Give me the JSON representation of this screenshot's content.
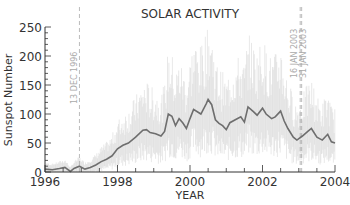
{
  "chart_data": {
    "type": "line",
    "title": "SOLAR ACTIVITY",
    "xlabel": "YEAR",
    "ylabel": "Sunspot Number",
    "xlim": [
      1996,
      2004
    ],
    "ylim": [
      0,
      250
    ],
    "xticks": [
      1996,
      1998,
      2000,
      2002,
      2004
    ],
    "yticks": [
      0,
      50,
      100,
      150,
      200,
      250
    ],
    "grid": false,
    "legend": null,
    "colors": {
      "smoothed": "#6e6e6e",
      "daily": "#d9d9d9",
      "axis": "#333333",
      "markers": "#aaaaaa"
    },
    "annotations": [
      {
        "x": 1996.95,
        "label": "13 DEC 1996",
        "style": "dashed"
      },
      {
        "x": 2003.04,
        "label": "16 JAN 2003",
        "style": "dashed"
      },
      {
        "x": 2003.08,
        "label": "31 JAN 2003",
        "style": "dashed"
      }
    ],
    "series": [
      {
        "name": "Smoothed sunspot number",
        "x": [
          1996.0,
          1996.2,
          1996.4,
          1996.55,
          1996.7,
          1996.8,
          1996.95,
          1997.1,
          1997.25,
          1997.4,
          1997.55,
          1997.7,
          1997.85,
          1998.0,
          1998.15,
          1998.3,
          1998.5,
          1998.7,
          1998.8,
          1998.9,
          1999.05,
          1999.2,
          1999.3,
          1999.4,
          1999.5,
          1999.6,
          1999.7,
          1999.8,
          1999.9,
          2000.0,
          2000.1,
          2000.2,
          2000.3,
          2000.45,
          2000.5,
          2000.6,
          2000.7,
          2000.8,
          2000.9,
          2001.0,
          2001.1,
          2001.25,
          2001.4,
          2001.5,
          2001.6,
          2001.75,
          2001.85,
          2002.0,
          2002.1,
          2002.25,
          2002.35,
          2002.5,
          2002.6,
          2002.7,
          2002.85,
          2002.95,
          2003.1,
          2003.25,
          2003.35,
          2003.5,
          2003.65,
          2003.8,
          2003.9,
          2004.0
        ],
        "values": [
          5,
          4,
          6,
          8,
          1,
          6,
          10,
          5,
          8,
          12,
          18,
          22,
          28,
          40,
          46,
          50,
          60,
          72,
          73,
          68,
          66,
          62,
          70,
          100,
          96,
          80,
          92,
          85,
          75,
          92,
          108,
          104,
          100,
          118,
          125,
          116,
          90,
          84,
          80,
          73,
          85,
          90,
          95,
          86,
          112,
          104,
          98,
          110,
          100,
          92,
          95,
          105,
          88,
          75,
          60,
          55,
          62,
          70,
          75,
          60,
          55,
          65,
          52,
          50
        ]
      },
      {
        "name": "Daily sunspot number",
        "note": "light gray noisy spikes, range approx 0-245"
      }
    ]
  }
}
